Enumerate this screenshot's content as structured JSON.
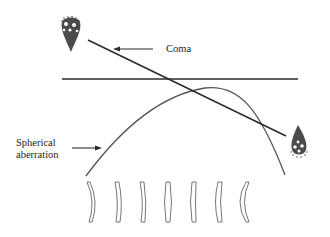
{
  "diagram": {
    "labels": {
      "coma": "Coma",
      "spherical_line1": "Spherical",
      "spherical_line2": "aberration"
    },
    "colors": {
      "line": "#2a2a2a",
      "curve": "#555555",
      "lens": "#777777",
      "background": "#ffffff"
    },
    "lens_count": 7
  }
}
